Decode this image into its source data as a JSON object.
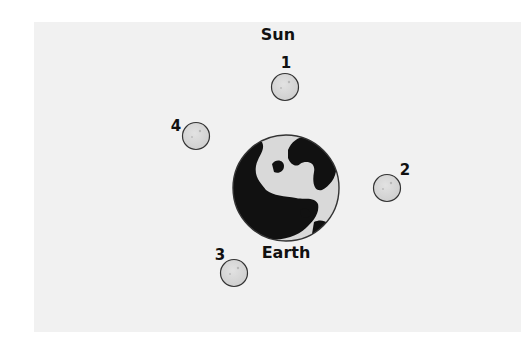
{
  "diagram": {
    "sun_label": "Sun",
    "earth_label": "Earth",
    "moons": [
      {
        "label": "1",
        "cx": 285,
        "cy": 87,
        "lx": 286,
        "ly": 63
      },
      {
        "label": "2",
        "cx": 387,
        "cy": 188,
        "lx": 405,
        "ly": 170
      },
      {
        "label": "3",
        "cx": 234,
        "cy": 273,
        "lx": 220,
        "ly": 255
      },
      {
        "label": "4",
        "cx": 196,
        "cy": 136,
        "lx": 176,
        "ly": 126
      }
    ],
    "colors": {
      "background": "#f1f1f1",
      "moon_fill": "#d6d6d6",
      "outline": "#333333",
      "earth_land": "#111111",
      "earth_ocean": "#d9d9d9"
    }
  }
}
